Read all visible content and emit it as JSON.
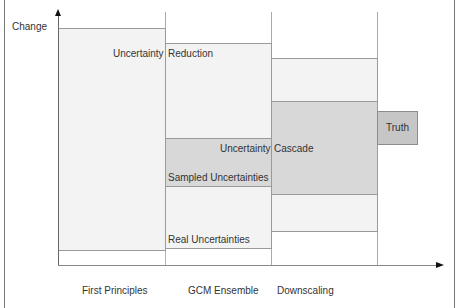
{
  "diagram": {
    "y_axis_label": "Change",
    "x_axis_categories": [
      "First Principles",
      "GCM Ensemble",
      "Downscaling"
    ],
    "labels": {
      "uncertainty_left": "Uncertainty",
      "reduction": "Reduction",
      "uncertainty_cascade_left": "Uncertainty",
      "cascade": "Cascade",
      "sampled_uncertainties": "Sampled Uncertainties",
      "real_uncertainties": "Real Uncertainties",
      "truth": "Truth"
    },
    "colors": {
      "light_fill": "#f3f3f3",
      "dark_fill": "#d8d8d8",
      "truth_fill": "#c6c6c6",
      "border": "#9a9a9a"
    }
  }
}
